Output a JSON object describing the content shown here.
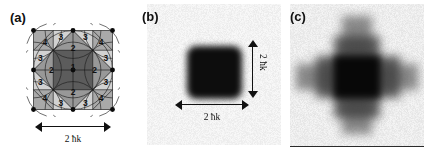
{
  "figure": {
    "panels": [
      {
        "id": "a",
        "label": "(a)",
        "type": "diagram",
        "description": "Octagonal momentum-space tiling diagram with numbered diffraction order regions",
        "regions": [
          {
            "order": "1",
            "shade": "dark-gray"
          },
          {
            "order": "2",
            "shade": "mid-gray"
          },
          {
            "order": "3",
            "shade": "light-gray"
          },
          {
            "order": "4",
            "shade": "mid-light-gray"
          }
        ],
        "scale": {
          "value": "2 ħk",
          "orientation": "horizontal"
        }
      },
      {
        "id": "b",
        "label": "(b)",
        "type": "absorption-image",
        "scale_horizontal": "2 ħk",
        "scale_vertical": "2 ħk"
      },
      {
        "id": "c",
        "label": "(c)",
        "type": "absorption-image"
      }
    ]
  },
  "chart_data": {
    "type": "heatmap",
    "title": "",
    "xlabel": "",
    "ylabel": "",
    "panels": [
      {
        "id": "a",
        "type": "diagram",
        "title": "(a)",
        "annotations": [
          "1",
          "2",
          "3",
          "4",
          "2 ħk"
        ],
        "region_labels": {
          "center": "1",
          "edge_diamond": "2",
          "corner_triangles": "3",
          "outer_squares": "4"
        },
        "region_label_positions": [
          {
            "text": "1",
            "x": 0.5,
            "y": 0.46
          },
          {
            "text": "2",
            "x": 0.5,
            "y": 0.225
          },
          {
            "text": "2",
            "x": 0.5,
            "y": 0.775
          },
          {
            "text": "2",
            "x": 0.225,
            "y": 0.5
          },
          {
            "text": "2",
            "x": 0.775,
            "y": 0.5
          },
          {
            "text": "3",
            "x": 0.345,
            "y": 0.085
          },
          {
            "text": "3",
            "x": 0.655,
            "y": 0.085
          },
          {
            "text": "3",
            "x": 0.345,
            "y": 0.915
          },
          {
            "text": "3",
            "x": 0.655,
            "y": 0.915
          },
          {
            "text": "3",
            "x": 0.085,
            "y": 0.345
          },
          {
            "text": "3",
            "x": 0.085,
            "y": 0.655
          },
          {
            "text": "3",
            "x": 0.915,
            "y": 0.345
          },
          {
            "text": "3",
            "x": 0.915,
            "y": 0.655
          },
          {
            "text": "4",
            "x": 0.145,
            "y": 0.145
          },
          {
            "text": "4",
            "x": 0.855,
            "y": 0.145
          },
          {
            "text": "4",
            "x": 0.145,
            "y": 0.855
          },
          {
            "text": "4",
            "x": 0.855,
            "y": 0.855
          }
        ],
        "vertex_dots": 8,
        "center_dot": true
      },
      {
        "id": "b",
        "type": "heatmap",
        "title": "(b)",
        "feature": "single dark square cloud at center",
        "feature_size": "2 ħk",
        "background_level": 0.95,
        "peak_level": 0.05
      },
      {
        "id": "c",
        "type": "heatmap",
        "title": "(c)",
        "feature": "cross-shaped diffraction pattern, dark square core with four gray arms",
        "background_level": 0.93,
        "peak_level": 0.03
      }
    ]
  }
}
